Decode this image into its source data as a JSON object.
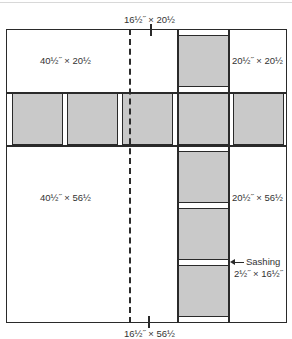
{
  "diagram": {
    "labels": {
      "top_dashed_section": "16½˝ × 20½",
      "bottom_dashed_section": "16½˝ × 56½",
      "top_left_panel": "40½˝ × 20½",
      "top_right_panel": "20½˝ × 20½",
      "bottom_left_panel": "40½˝ × 56½",
      "bottom_right_panel": "20½˝ × 56½",
      "sashing_title": "Sashing",
      "sashing_size": "2½˝ × 16½˝"
    },
    "colors": {
      "block_fill": "#c9c9c9",
      "outline": "#2a2a2a",
      "background": "#ffffff"
    },
    "horizontal_band_blocks": 5,
    "vertical_column_blocks_below_band": 3,
    "vertical_column_blocks_above_band": 1
  }
}
